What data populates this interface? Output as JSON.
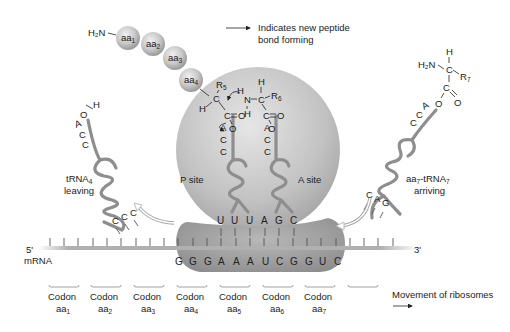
{
  "legend": {
    "peptide_bond_line1": "Indicates new peptide",
    "peptide_bond_line2": "bond forming"
  },
  "peptide_chain": {
    "n_terminus": "H₂N",
    "beads": [
      {
        "base": "aa",
        "sub": "1"
      },
      {
        "base": "aa",
        "sub": "2"
      },
      {
        "base": "aa",
        "sub": "3"
      },
      {
        "base": "aa",
        "sub": "4"
      }
    ]
  },
  "p_site_chem": {
    "r_group": "R",
    "r_sub": "5",
    "h": "H",
    "c_alpha": "C",
    "c_carbonyl": "C",
    "o_double": "O",
    "o_ester": "O"
  },
  "a_site_chem": {
    "h_top": "H",
    "r_group": "R",
    "r_sub": "6",
    "n": "N",
    "h_n1": "H",
    "h_n2": "H",
    "c_alpha": "C",
    "c_carbonyl": "C",
    "o_double": "O",
    "o_ester": "O"
  },
  "ribosome": {
    "p_site_label": "P site",
    "a_site_label": "A site",
    "p_trna_acc": [
      "A",
      "C",
      "C"
    ],
    "a_trna_acc": [
      "A",
      "C",
      "C"
    ],
    "anticodons": [
      "U",
      "U",
      "U",
      "A",
      "G",
      "C"
    ]
  },
  "leaving_trna": {
    "label_line1": "tRNA",
    "label_sub": "4",
    "label_line2": "leaving",
    "o": "O",
    "h": "H",
    "acc": [
      "A",
      "C",
      "C"
    ],
    "anticodon": [
      "C",
      "C",
      "C"
    ]
  },
  "arriving_trna": {
    "label_prefix": "aa",
    "label_sub1": "7",
    "label_mid": "-tRNA",
    "label_sub2": "7",
    "label_line2": "arriving",
    "h": "H",
    "h2n": "H₂N",
    "c_alpha": "C",
    "r_group": "R",
    "r_sub": "7",
    "c_carbonyl": "C",
    "o_ester": "O",
    "o_double": "O",
    "acc": [
      "A",
      "C",
      "C"
    ],
    "anticodon": [
      "C",
      "A",
      "G"
    ]
  },
  "mrna": {
    "five_prime": "5'",
    "three_prime": "3'",
    "label": "mRNA",
    "sequence": [
      "G",
      "G",
      "G",
      "A",
      "A",
      "A",
      "U",
      "C",
      "G",
      "G",
      "U",
      "C"
    ]
  },
  "codons": [
    {
      "line1": "Codon",
      "aa": "aa",
      "sub": "1"
    },
    {
      "line1": "Codon",
      "aa": "aa",
      "sub": "2"
    },
    {
      "line1": "Codon",
      "aa": "aa",
      "sub": "3"
    },
    {
      "line1": "Codon",
      "aa": "aa",
      "sub": "4"
    },
    {
      "line1": "Codon",
      "aa": "aa",
      "sub": "5"
    },
    {
      "line1": "Codon",
      "aa": "aa",
      "sub": "6"
    },
    {
      "line1": "Codon",
      "aa": "aa",
      "sub": "7"
    }
  ],
  "movement": {
    "label": "Movement of ribosomes"
  },
  "colors": {
    "ribosome_light": "#d9d9d9",
    "ribosome_dark": "#9a9a9a",
    "trna": "#8e8e8e",
    "bead": "#c4c4c4"
  }
}
